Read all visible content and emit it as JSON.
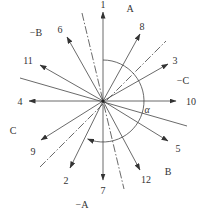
{
  "diagram": {
    "title": "",
    "center": {
      "x": 103,
      "y": 101
    },
    "arrows": [
      {
        "id": "1",
        "label": "1",
        "end": [
          103,
          12
        ],
        "label_pos": [
          103,
          8
        ]
      },
      {
        "id": "8",
        "label": "8",
        "end": [
          140,
          34
        ],
        "label_pos": [
          142,
          30
        ]
      },
      {
        "id": "3",
        "label": "3",
        "end": [
          168,
          64
        ],
        "label_pos": [
          175,
          64
        ]
      },
      {
        "id": "10",
        "label": "10",
        "end": [
          176,
          101
        ],
        "label_pos": [
          191,
          105
        ]
      },
      {
        "id": "5",
        "label": "5",
        "end": [
          168,
          141
        ],
        "label_pos": [
          178,
          152
        ]
      },
      {
        "id": "12",
        "label": "12",
        "end": [
          140,
          170
        ],
        "label_pos": [
          146,
          183
        ]
      },
      {
        "id": "7",
        "label": "7",
        "end": [
          103,
          180
        ],
        "label_pos": [
          103,
          194
        ]
      },
      {
        "id": "2",
        "label": "2",
        "end": [
          70,
          168
        ],
        "label_pos": [
          66,
          184
        ]
      },
      {
        "id": "9",
        "label": "9",
        "end": [
          41,
          140
        ],
        "label_pos": [
          33,
          155
        ]
      },
      {
        "id": "4",
        "label": "4",
        "end": [
          29,
          101
        ],
        "label_pos": [
          20,
          105
        ]
      },
      {
        "id": "11",
        "label": "11",
        "end": [
          40,
          65
        ],
        "label_pos": [
          28,
          64
        ]
      },
      {
        "id": "6",
        "label": "6",
        "end": [
          67,
          37
        ],
        "label_pos": [
          60,
          33
        ]
      }
    ],
    "dashdot_lines": [
      {
        "name": "axis-a",
        "from": [
          82,
          13
        ],
        "to": [
          124,
          189
        ]
      },
      {
        "name": "axis-c",
        "from": [
          40,
          167
        ],
        "to": [
          166,
          41
        ]
      }
    ],
    "solid_lines": [
      {
        "name": "axis-b",
        "from": [
          20,
          78
        ],
        "to": [
          187,
          126
        ]
      }
    ],
    "phase_labels": [
      {
        "label": "A",
        "pos": [
          130,
          12
        ]
      },
      {
        "label": "−B",
        "pos": [
          36,
          36
        ]
      },
      {
        "label": "−C",
        "pos": [
          183,
          84
        ]
      },
      {
        "label": "C",
        "pos": [
          13,
          134
        ]
      },
      {
        "label": "B",
        "pos": [
          168,
          175
        ]
      },
      {
        "label": "−A",
        "pos": [
          82,
          208
        ]
      }
    ],
    "angle": {
      "symbol": "α",
      "pos": [
        147,
        113
      ]
    },
    "arc": {
      "radius": 41,
      "start_angle_deg": -90,
      "end_angle_deg": 112
    }
  }
}
